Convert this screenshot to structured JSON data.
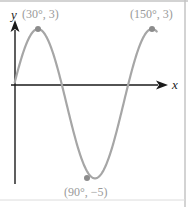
{
  "chart_data": {
    "type": "line",
    "title": "",
    "xlabel": "x",
    "ylabel": "y",
    "function": "y = 4 sin(3x) - 1",
    "x_unit": "degrees",
    "x": [
      0,
      30,
      60,
      90,
      120,
      150,
      180
    ],
    "y": [
      -1,
      3,
      -1,
      -5,
      -1,
      3,
      -1
    ],
    "annotations": [
      {
        "label": "(30°, 3)",
        "x": 30,
        "y": 3
      },
      {
        "label": "(150°, 3)",
        "x": 150,
        "y": 3
      },
      {
        "label": "(90°, −5)",
        "x": 90,
        "y": -5
      }
    ],
    "grid": false,
    "legend": null,
    "colors": {
      "curve": "#a6a6a6",
      "axes": "#1a1a1a",
      "points": "#8c8c8c",
      "labels": "#9a9a9a",
      "frame": "#bdbdbd"
    }
  },
  "labels": {
    "peak1": "(30°, 3)",
    "peak2": "(150°, 3)",
    "trough": "(90°, −5)",
    "x_axis": "x",
    "y_axis": "y"
  }
}
